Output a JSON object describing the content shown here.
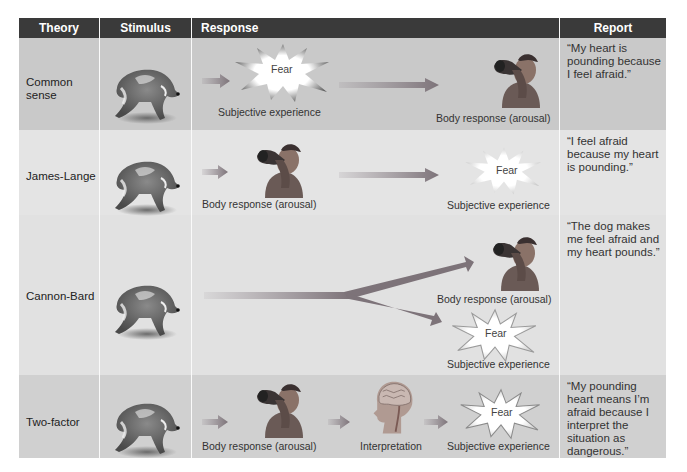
{
  "header": {
    "columns": [
      "Theory",
      "Stimulus",
      "Response",
      "Report"
    ]
  },
  "colors": {
    "header_bg": "#3a3a3a",
    "header_text": "#ffffff",
    "row_dark": "#c9c9c9",
    "row_light": "#e4e4e4",
    "arrow": "#8a8088",
    "burst_fill": "#ffffff",
    "burst_edge": "#6e6e6e"
  },
  "rows": [
    {
      "theory": "Common sense",
      "stimulus_icon": "running-dog",
      "response": [
        {
          "type": "burst",
          "label": "Fear",
          "caption": "Subjective experience"
        },
        {
          "type": "arrow"
        },
        {
          "type": "person",
          "caption": "Body response (arousal)"
        }
      ],
      "report": "“My heart is pounding because I feel afraid.”"
    },
    {
      "theory": "James-Lange",
      "stimulus_icon": "running-dog",
      "response": [
        {
          "type": "person",
          "caption": "Body response (arousal)"
        },
        {
          "type": "arrow"
        },
        {
          "type": "burst",
          "label": "Fear",
          "caption": "Subjective experience"
        }
      ],
      "report": "“I feel afraid because my heart is pounding.”"
    },
    {
      "theory": "Cannon-Bard",
      "stimulus_icon": "running-dog",
      "response": [
        {
          "type": "forked-arrow"
        },
        {
          "type": "person",
          "caption": "Body response (arousal)"
        },
        {
          "type": "burst",
          "label": "Fear",
          "caption": "Subjective experience"
        }
      ],
      "report": "“The dog makes me feel afraid and my heart pounds.”"
    },
    {
      "theory": "Two-factor",
      "stimulus_icon": "running-dog",
      "response": [
        {
          "type": "person",
          "caption": "Body response (arousal)"
        },
        {
          "type": "brain",
          "caption": "Interpretation"
        },
        {
          "type": "burst",
          "label": "Fear",
          "caption": "Subjective experience"
        }
      ],
      "report": "“My pounding heart means I’m afraid because I interpret the situation as dangerous.”"
    }
  ]
}
